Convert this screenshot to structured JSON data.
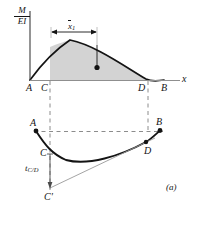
{
  "figure": {
    "tag": "(a)",
    "caption_tag_name": "figure-label-a",
    "colors": {
      "shade_fill": "#d3d3d3",
      "curve_stroke": "#141414",
      "axis_stroke": "#3c3c3c",
      "dashed_stroke": "#8c8c8c",
      "thin_line": "#9a9a9a",
      "background": "#ffffff"
    }
  },
  "moment_diagram": {
    "axis_vertical_label": {
      "numerator": "M",
      "denominator": "EI"
    },
    "axis_horizontal_label": "x",
    "dimension_label": {
      "symbol": "x",
      "overbar": true,
      "subscript": "1"
    },
    "points": [
      {
        "id": "A",
        "label": "A",
        "x": 30,
        "y": 80
      },
      {
        "id": "C",
        "label": "C",
        "x": 50,
        "y": 80
      },
      {
        "id": "D",
        "label": "D",
        "x": 146,
        "y": 80
      },
      {
        "id": "B",
        "label": "B",
        "x": 164,
        "y": 80
      }
    ],
    "centroid_marker": "centroid-dot",
    "shaded_region": "M/EI area between C and D"
  },
  "deflection_diagram": {
    "points": [
      {
        "id": "A",
        "label": "A",
        "x": 36,
        "y": 131
      },
      {
        "id": "B",
        "label": "B",
        "x": 160,
        "y": 130
      },
      {
        "id": "C",
        "label": "C",
        "x": 50,
        "y": 155
      },
      {
        "id": "D",
        "label": "D",
        "x": 146,
        "y": 142
      },
      {
        "id": "Cprime",
        "label": "C'",
        "x": 50,
        "y": 190
      }
    ],
    "tangential_deviation": {
      "symbol": "t",
      "subscript": "C/D"
    }
  }
}
